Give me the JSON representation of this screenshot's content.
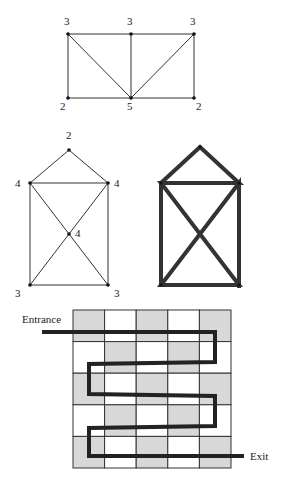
{
  "graphs": {
    "top": {
      "vertices": [
        {
          "id": "a",
          "x": 68,
          "y": 34,
          "degree": "3",
          "lx": 64,
          "ly": 25
        },
        {
          "id": "b",
          "x": 131,
          "y": 34,
          "degree": "3",
          "lx": 127,
          "ly": 25
        },
        {
          "id": "c",
          "x": 194,
          "y": 34,
          "degree": "3",
          "lx": 190,
          "ly": 25
        },
        {
          "id": "d",
          "x": 68,
          "y": 98,
          "degree": "2",
          "lx": 60,
          "ly": 110
        },
        {
          "id": "e",
          "x": 131,
          "y": 98,
          "degree": "5",
          "lx": 127,
          "ly": 110
        },
        {
          "id": "f",
          "x": 194,
          "y": 98,
          "degree": "2",
          "lx": 196,
          "ly": 110
        }
      ],
      "edges": [
        [
          "a",
          "b"
        ],
        [
          "b",
          "c"
        ],
        [
          "a",
          "d"
        ],
        [
          "c",
          "f"
        ],
        [
          "d",
          "e"
        ],
        [
          "e",
          "f"
        ],
        [
          "a",
          "e"
        ],
        [
          "b",
          "e"
        ],
        [
          "c",
          "e"
        ]
      ]
    },
    "house": {
      "vertices": [
        {
          "id": "t",
          "x": 69,
          "y": 150,
          "degree": "2",
          "lx": 66,
          "ly": 139
        },
        {
          "id": "l",
          "x": 30,
          "y": 183,
          "degree": "4",
          "lx": 15,
          "ly": 187
        },
        {
          "id": "r",
          "x": 108,
          "y": 183,
          "degree": "4",
          "lx": 114,
          "ly": 187
        },
        {
          "id": "m",
          "x": 69,
          "y": 234,
          "degree": "4",
          "lx": 75,
          "ly": 237
        },
        {
          "id": "bl",
          "x": 30,
          "y": 285,
          "degree": "3",
          "lx": 15,
          "ly": 297
        },
        {
          "id": "br",
          "x": 108,
          "y": 285,
          "degree": "3",
          "lx": 114,
          "ly": 297
        }
      ],
      "edges": [
        [
          "t",
          "l"
        ],
        [
          "t",
          "r"
        ],
        [
          "l",
          "r"
        ],
        [
          "l",
          "bl"
        ],
        [
          "r",
          "br"
        ],
        [
          "bl",
          "br"
        ],
        [
          "l",
          "m"
        ],
        [
          "m",
          "br"
        ],
        [
          "r",
          "m"
        ],
        [
          "m",
          "bl"
        ]
      ]
    },
    "house_traced": {
      "path": "M161,285 L161,183 L200,147 L239,183 L161,183 L239,285 L161,285 L239,183 L239,288"
    }
  },
  "maze": {
    "entrance_label": "Entrance",
    "exit_label": "Exit",
    "grid": {
      "x": 73,
      "y": 310,
      "cols": 5,
      "rows": 5,
      "cell": 31.6
    },
    "shaded": [
      [
        1,
        0,
        1,
        0,
        1
      ],
      [
        0,
        1,
        0,
        1,
        0
      ],
      [
        1,
        0,
        1,
        0,
        1
      ],
      [
        0,
        1,
        0,
        1,
        0
      ],
      [
        1,
        0,
        1,
        0,
        1
      ]
    ],
    "path": "M42,332 L215,332 L215,362 L89,364 L89,394 L215,396 L215,426 L89,428 L89,456 L244,456"
  }
}
